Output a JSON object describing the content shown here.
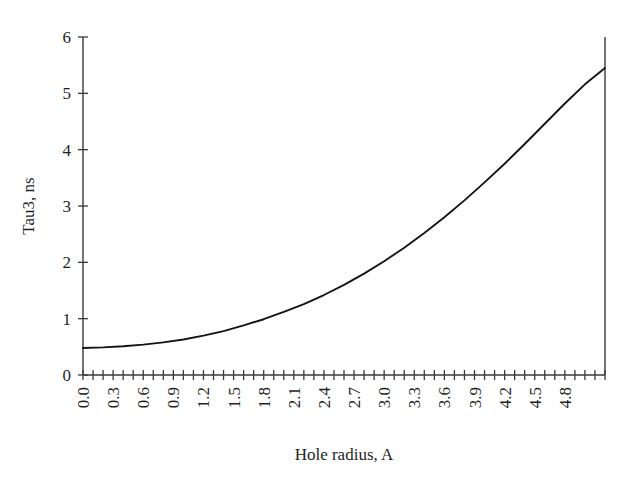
{
  "chart_data": {
    "type": "line",
    "title": "",
    "subtitle": "",
    "xlabel": "Hole radius, A",
    "ylabel": "Tau3, ns",
    "xlim": [
      0.0,
      5.2
    ],
    "ylim": [
      0,
      6
    ],
    "grid": false,
    "legend": null,
    "x_tick_labels": [
      "0.0",
      "0.3",
      "0.6",
      "0.9",
      "1.2",
      "1.5",
      "1.8",
      "2.1",
      "2.4",
      "2.7",
      "3.0",
      "3.3",
      "3.6",
      "3.9",
      "4.2",
      "4.5",
      "4.8"
    ],
    "x_tick_values": [
      0.0,
      0.3,
      0.6,
      0.9,
      1.2,
      1.5,
      1.8,
      2.1,
      2.4,
      2.7,
      3.0,
      3.3,
      3.6,
      3.9,
      4.2,
      4.5,
      4.8
    ],
    "x_minor_step": 0.1,
    "y_tick_labels": [
      "0",
      "1",
      "2",
      "3",
      "4",
      "5",
      "6"
    ],
    "y_tick_values": [
      0,
      1,
      2,
      3,
      4,
      5,
      6
    ],
    "x_tick_label_rotation": -90,
    "series": [
      {
        "name": "Tau3",
        "color": "#141414",
        "x": [
          0.0,
          0.2,
          0.4,
          0.6,
          0.8,
          1.0,
          1.2,
          1.4,
          1.6,
          1.8,
          2.0,
          2.2,
          2.4,
          2.6,
          2.8,
          3.0,
          3.2,
          3.4,
          3.6,
          3.8,
          4.0,
          4.2,
          4.4,
          4.6,
          4.8,
          5.0,
          5.2
        ],
        "y": [
          0.48,
          0.49,
          0.51,
          0.54,
          0.58,
          0.63,
          0.7,
          0.78,
          0.88,
          0.99,
          1.12,
          1.26,
          1.42,
          1.6,
          1.8,
          2.02,
          2.26,
          2.52,
          2.8,
          3.1,
          3.42,
          3.75,
          4.1,
          4.46,
          4.82,
          5.16,
          5.45
        ]
      }
    ],
    "right_spine": {
      "present": true,
      "x": 5.2,
      "y_from": 0,
      "y_to": 6
    }
  },
  "axes": {
    "y_axis_name": "y-axis",
    "x_axis_name": "x-axis"
  }
}
